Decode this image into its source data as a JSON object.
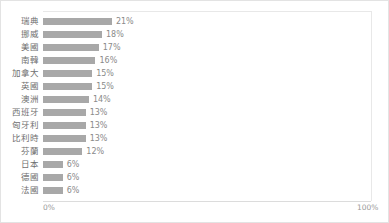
{
  "chart_data": {
    "type": "bar",
    "orientation": "horizontal",
    "title": "",
    "xlabel": "",
    "ylabel": "",
    "categories": [
      "瑞典",
      "挪威",
      "美國",
      "南韓",
      "加拿大",
      "英國",
      "澳洲",
      "西班牙",
      "匈牙利",
      "比利時",
      "芬蘭",
      "日本",
      "德國",
      "法國"
    ],
    "values": [
      21,
      18,
      17,
      16,
      15,
      15,
      14,
      13,
      13,
      13,
      12,
      6,
      6,
      6
    ],
    "value_labels": [
      "21%",
      "18%",
      "17%",
      "16%",
      "15%",
      "15%",
      "14%",
      "13%",
      "13%",
      "13%",
      "12%",
      "6%",
      "6%",
      "6%"
    ],
    "xlim": [
      0,
      100
    ],
    "xticks": [
      0,
      100
    ],
    "xtick_labels": [
      "0%",
      "100%"
    ],
    "grid": false,
    "legend": false,
    "bar_color": "#a8a8a8",
    "label_color": "#6f6f6f",
    "value_color": "#8a8a8a",
    "axis_color": "#dcdcdc",
    "frame_color": "#e3e3e3"
  },
  "axis": {
    "left_tick": "0%",
    "right_tick": "100%"
  },
  "footer": {
    "source_note": ""
  }
}
